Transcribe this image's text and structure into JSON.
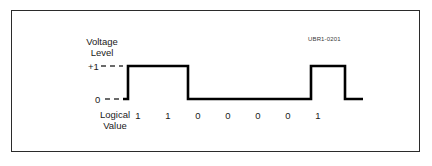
{
  "figure": {
    "doc_id": "UBR1-0201",
    "axis_title_line1": "Voltage",
    "axis_title_line2": "Level",
    "level_high_label": "+1",
    "level_zero_label": "0",
    "logical_label_line1": "Logical",
    "logical_label_line2": "Value",
    "colors": {
      "frame": "#2b2b2b",
      "trace": "#000000",
      "background": "#ffffff",
      "text": "#1a1a1a"
    }
  },
  "chart_data": {
    "type": "line",
    "title": "",
    "xlabel": "Logical Value",
    "ylabel": "Voltage Level",
    "ylim": [
      0,
      1
    ],
    "ytick_labels": [
      "0",
      "+1"
    ],
    "ytick_values": [
      0,
      1
    ],
    "grid": false,
    "legend": null,
    "signal_encoding": "unipolar-NRZ",
    "categories": [
      "1",
      "1",
      "0",
      "0",
      "0",
      "0",
      "1"
    ],
    "values": [
      1,
      1,
      0,
      0,
      0,
      0,
      1
    ],
    "bit_centers_px": [
      138,
      168,
      198,
      228,
      258,
      288,
      318
    ],
    "bit_width_px": 30,
    "baseline_y_px": 99,
    "high_y_px": 66,
    "trace_start_x_px": 123,
    "trace_end_x_px": 363,
    "annotations": [
      {
        "text": "UBR1-0201",
        "x_px": 308,
        "y_px": 36
      }
    ]
  }
}
